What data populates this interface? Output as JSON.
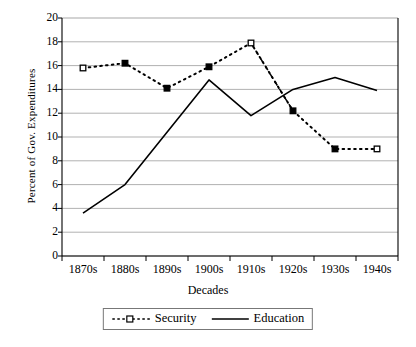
{
  "chart_data": {
    "type": "line",
    "title": "",
    "xlabel": "Decades",
    "ylabel": "Percent of Gov. Expenditures",
    "categories": [
      "1870s",
      "1880s",
      "1890s",
      "1900s",
      "1910s",
      "1920s",
      "1930s",
      "1940s"
    ],
    "ylim": [
      0,
      20
    ],
    "ytick_step": 2,
    "yticks": [
      "20",
      "18",
      "16",
      "14",
      "12",
      "10",
      "8",
      "6",
      "4",
      "2",
      "0"
    ],
    "grid": "horizontal",
    "legend_position": "bottom",
    "series": [
      {
        "name": "Security",
        "style": "dotted",
        "marker": "square",
        "color": "#000000",
        "values": [
          15.8,
          16.2,
          14.1,
          15.9,
          17.9,
          12.2,
          9.0,
          9.0
        ]
      },
      {
        "name": "Education",
        "style": "solid",
        "marker": "none",
        "color": "#000000",
        "values": [
          3.6,
          6.0,
          10.4,
          14.8,
          11.8,
          14.0,
          15.0,
          13.9
        ]
      }
    ]
  },
  "legend": {
    "items": [
      {
        "label": "Security"
      },
      {
        "label": "Education"
      }
    ]
  }
}
